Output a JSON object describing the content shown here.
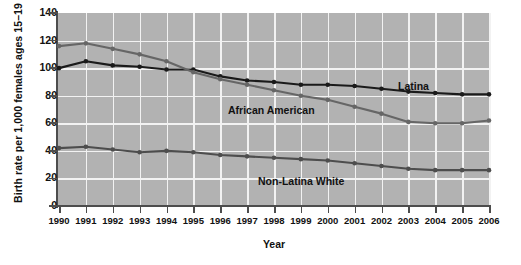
{
  "chart_data": {
    "type": "line",
    "title": "",
    "xlabel": "Year",
    "ylabel": "Birth rate per 1,000 females ages 15–19",
    "categories": [
      "1990",
      "1991",
      "1992",
      "1993",
      "1994",
      "1995",
      "1996",
      "1997",
      "1998",
      "1999",
      "2000",
      "2001",
      "2002",
      "2003",
      "2004",
      "2005",
      "2006"
    ],
    "ylim": [
      0,
      140
    ],
    "yticks": [
      0,
      20,
      40,
      60,
      80,
      100,
      120,
      140
    ],
    "grid": true,
    "legend_position": "inline-annotations",
    "series": [
      {
        "name": "Latina",
        "color": "#1a1a1a",
        "values": [
          100,
          105,
          102,
          101,
          99,
          99,
          94,
          91,
          90,
          88,
          88,
          87,
          85,
          83,
          82,
          81,
          81
        ]
      },
      {
        "name": "African American",
        "color": "#666666",
        "values": [
          116,
          118,
          114,
          110,
          105,
          97,
          92,
          88,
          84,
          80,
          77,
          72,
          67,
          61,
          60,
          60,
          62
        ]
      },
      {
        "name": "Non-Latina White",
        "color": "#4d4d4d",
        "values": [
          42,
          43,
          41,
          39,
          40,
          39,
          37,
          36,
          35,
          34,
          33,
          31,
          29,
          27,
          26,
          26,
          26
        ]
      }
    ],
    "annotations": [
      {
        "text": "Latina",
        "series": "Latina"
      },
      {
        "text": "African American",
        "series": "African American"
      },
      {
        "text": "Non-Latina White",
        "series": "Non-Latina White"
      }
    ]
  }
}
